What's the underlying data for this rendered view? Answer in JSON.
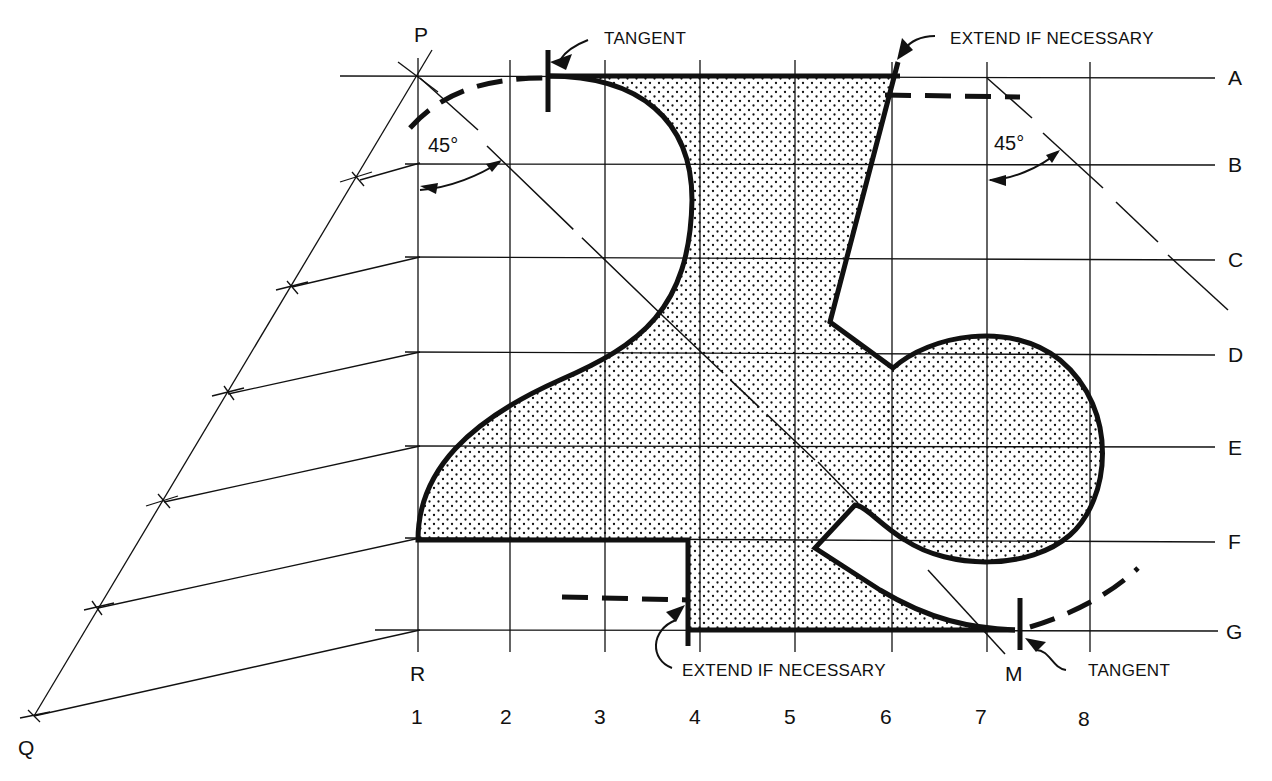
{
  "diagram": {
    "points": {
      "P": "P",
      "Q": "Q",
      "R": "R",
      "M": "M"
    },
    "rows": [
      "A",
      "B",
      "C",
      "D",
      "E",
      "F",
      "G"
    ],
    "columns": [
      "1",
      "2",
      "3",
      "4",
      "5",
      "6",
      "7",
      "8"
    ],
    "annotations": {
      "tangent_top": "TANGENT",
      "extend_top": "EXTEND IF NECESSARY",
      "extend_bottom": "EXTEND IF NECESSARY",
      "tangent_bottom": "TANGENT",
      "angle_left": "45°",
      "angle_right": "45°"
    },
    "colors": {
      "ink": "#111111",
      "paper": "#ffffff"
    }
  }
}
